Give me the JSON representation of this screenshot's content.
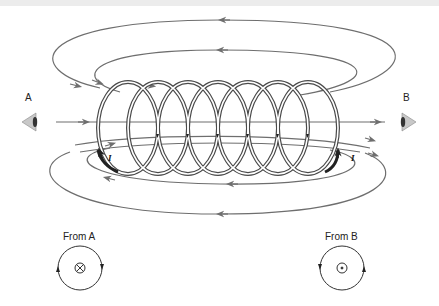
{
  "diagram": {
    "observers": {
      "a": {
        "label": "A",
        "icon": "eye-icon-facing-right"
      },
      "b": {
        "label": "B",
        "icon": "eye-icon-facing-left"
      }
    },
    "current_labels": {
      "left": "I",
      "right": "I"
    },
    "coil": {
      "turns": 7,
      "color": "#555555"
    },
    "field_line_color": "#6e6e6e",
    "views": {
      "from_a": {
        "label": "From A",
        "symbol": "⊗",
        "meaning": "field into page",
        "circulation": "clockwise"
      },
      "from_b": {
        "label": "From B",
        "symbol": "⊙",
        "meaning": "field out of page",
        "circulation": "counterclockwise"
      }
    }
  }
}
